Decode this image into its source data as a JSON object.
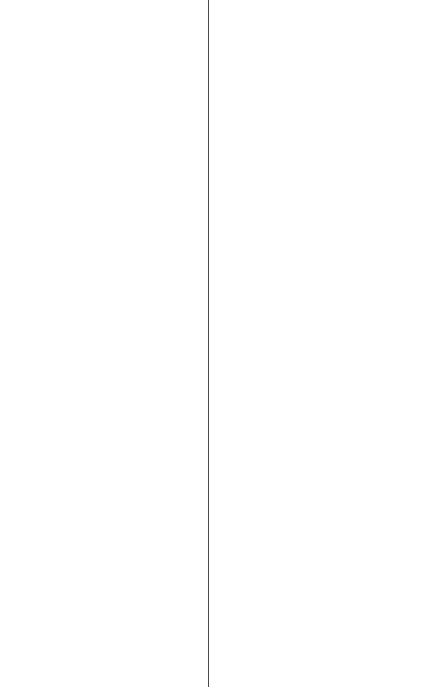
{
  "layout": {
    "left_pane": {
      "content": ""
    },
    "divider": {
      "color": "#4a4a4a",
      "x": 208
    },
    "right_pane": {
      "content": ""
    }
  }
}
